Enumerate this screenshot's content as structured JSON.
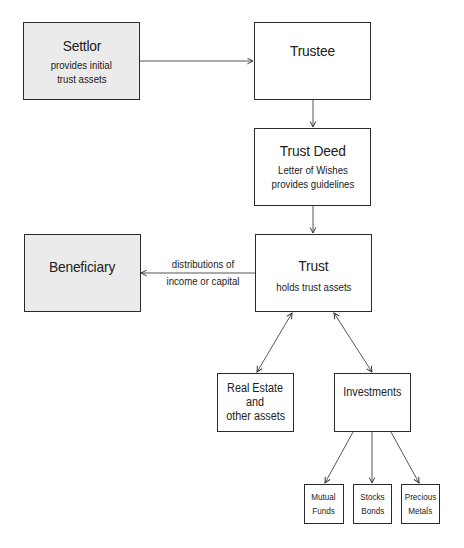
{
  "diagram": {
    "nodes": {
      "settlor": {
        "title": "Settlor",
        "lines": [
          "provides initial",
          "trust assets"
        ]
      },
      "trustee": {
        "title": "Trustee"
      },
      "trust_deed": {
        "title": "Trust Deed",
        "lines": [
          "Letter of Wishes",
          "provides guidelines"
        ]
      },
      "beneficiary": {
        "title": "Beneficiary"
      },
      "trust": {
        "title": "Trust",
        "lines": [
          "holds trust assets"
        ]
      },
      "real_estate": {
        "lines": [
          "Real Estate",
          "and",
          "other assets"
        ]
      },
      "investments": {
        "title": "Investments"
      },
      "mutual_funds": {
        "lines": [
          "Mutual",
          "Funds"
        ]
      },
      "stocks_bonds": {
        "lines": [
          "Stocks",
          "Bonds"
        ]
      },
      "precious_metals": {
        "lines": [
          "Precious",
          "Metals"
        ]
      }
    },
    "edges": [
      {
        "from": "settlor",
        "to": "trustee",
        "label": ""
      },
      {
        "from": "trustee",
        "to": "trust_deed",
        "label": ""
      },
      {
        "from": "trust_deed",
        "to": "trust",
        "label": ""
      },
      {
        "from": "trust",
        "to": "beneficiary",
        "label_lines": [
          "distributions of",
          "income or capital"
        ]
      },
      {
        "from": "trust",
        "to": "real_estate",
        "bidirectional": true
      },
      {
        "from": "trust",
        "to": "investments",
        "bidirectional": true
      },
      {
        "from": "investments",
        "to": "mutual_funds"
      },
      {
        "from": "investments",
        "to": "stocks_bonds"
      },
      {
        "from": "investments",
        "to": "precious_metals"
      }
    ],
    "colors": {
      "shaded_fill": "#ebebeb",
      "border": "#2b2b2b",
      "line": "#555555"
    }
  }
}
